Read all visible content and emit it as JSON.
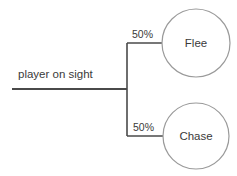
{
  "diagram": {
    "type": "decision-tree",
    "root": {
      "label": "player on sight"
    },
    "branches": [
      {
        "probability": "50%",
        "outcome": "Flee"
      },
      {
        "probability": "50%",
        "outcome": "Chase"
      }
    ],
    "colors": {
      "line": "#4a4a4a",
      "circle_stroke": "#9a9a9a",
      "text": "#3a3a3a",
      "background": "#ffffff"
    }
  }
}
